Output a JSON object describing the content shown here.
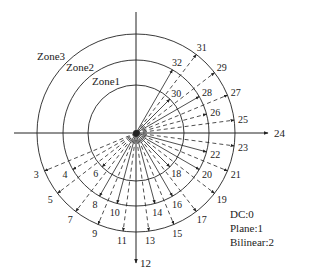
{
  "diagram": {
    "center": {
      "x": 136,
      "y": 133
    },
    "axes": {
      "horizontal": {
        "x1": 14,
        "x2": 268,
        "arrow_label": "24"
      },
      "vertical": {
        "y1": 12,
        "y2": 263,
        "arrow_label": "12"
      }
    },
    "zones": [
      {
        "label": "Zone1",
        "radius": 48,
        "label_x": 92,
        "label_y": 85
      },
      {
        "label": "Zone2",
        "radius": 73,
        "label_x": 66,
        "label_y": 71
      },
      {
        "label": "Zone3",
        "radius": 99,
        "label_x": 37,
        "label_y": 60
      }
    ],
    "angle_step_deg": 7.5,
    "reference_mode": 24,
    "rays": [
      {
        "mode": 3,
        "zone": 3,
        "style": "dashed"
      },
      {
        "mode": 4,
        "zone": 2,
        "style": "dashed"
      },
      {
        "mode": 5,
        "zone": 3,
        "style": "dashed"
      },
      {
        "mode": 6,
        "zone": 1,
        "style": "dashed"
      },
      {
        "mode": 7,
        "zone": 3,
        "style": "dashed"
      },
      {
        "mode": 8,
        "zone": 2,
        "style": "solid"
      },
      {
        "mode": 9,
        "zone": 3,
        "style": "dashed"
      },
      {
        "mode": 10,
        "zone": 2,
        "style": "solid"
      },
      {
        "mode": 11,
        "zone": 3,
        "style": "dashed"
      },
      {
        "mode": 13,
        "zone": 3,
        "style": "dashed"
      },
      {
        "mode": 14,
        "zone": 2,
        "style": "solid"
      },
      {
        "mode": 15,
        "zone": 3,
        "style": "dashed"
      },
      {
        "mode": 16,
        "zone": 2,
        "style": "solid"
      },
      {
        "mode": 17,
        "zone": 3,
        "style": "dashed"
      },
      {
        "mode": 18,
        "zone": 1,
        "style": "solid"
      },
      {
        "mode": 19,
        "zone": 3,
        "style": "dashed"
      },
      {
        "mode": 20,
        "zone": 2,
        "style": "solid"
      },
      {
        "mode": 21,
        "zone": 3,
        "style": "dashed"
      },
      {
        "mode": 22,
        "zone": 2,
        "style": "solid"
      },
      {
        "mode": 23,
        "zone": 3,
        "style": "dashed"
      },
      {
        "mode": 25,
        "zone": 3,
        "style": "dashed"
      },
      {
        "mode": 26,
        "zone": 2,
        "style": "dashed"
      },
      {
        "mode": 27,
        "zone": 3,
        "style": "dashed"
      },
      {
        "mode": 28,
        "zone": 2,
        "style": "solid"
      },
      {
        "mode": 29,
        "zone": 3,
        "style": "dashed"
      },
      {
        "mode": 30,
        "zone": 1,
        "style": "solid"
      },
      {
        "mode": 31,
        "zone": 3,
        "style": "dashed"
      },
      {
        "mode": 32,
        "zone": 2,
        "style": "solid"
      }
    ],
    "legend": [
      {
        "text": "DC:0"
      },
      {
        "text": "Plane:1"
      },
      {
        "text": "Bilinear:2"
      }
    ],
    "colors": {
      "stroke": "#222222",
      "background": "#ffffff"
    }
  }
}
